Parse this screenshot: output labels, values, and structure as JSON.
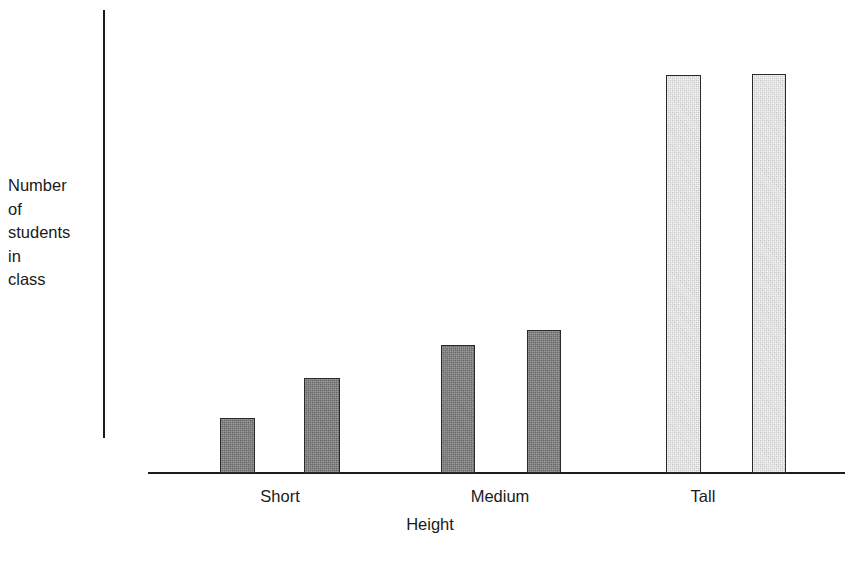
{
  "chart_data": {
    "type": "bar",
    "title": "",
    "subtitle": "",
    "xlabel": "Height",
    "ylabel": "Number\nof\nstudents\nin\nclass",
    "ylabel_lines": [
      "Number",
      "of",
      "students",
      "in",
      "class"
    ],
    "categories": [
      "Short",
      "Medium",
      "Tall"
    ],
    "grid": false,
    "legend": "none",
    "y_axis_ticks": [],
    "x_axis_ticks": [
      "Short",
      "Medium",
      "Tall"
    ],
    "ylim": [
      0,
      17
    ],
    "series": [
      {
        "name": "Group A",
        "values": [
          2,
          5,
          15
        ],
        "color": "#6e6e6e"
      },
      {
        "name": "Group B",
        "values": [
          3.5,
          5.5,
          15
        ],
        "color": "#6e6e6e"
      }
    ],
    "bars": [
      {
        "category": "Short",
        "member": 1,
        "value": 2,
        "fill": "dark",
        "left": 220,
        "width": 35,
        "top": 418,
        "height": 55
      },
      {
        "category": "Short",
        "member": 2,
        "value": 3.5,
        "fill": "dark",
        "left": 304,
        "width": 36,
        "top": 378,
        "height": 95
      },
      {
        "category": "Medium",
        "member": 1,
        "value": 5,
        "fill": "dark",
        "left": 441,
        "width": 34,
        "top": 345,
        "height": 128
      },
      {
        "category": "Medium",
        "member": 2,
        "value": 5.5,
        "fill": "dark",
        "left": 527,
        "width": 34,
        "top": 330,
        "height": 143
      },
      {
        "category": "Tall",
        "member": 1,
        "value": 15,
        "fill": "light",
        "left": 666,
        "width": 35,
        "top": 75,
        "height": 398
      },
      {
        "category": "Tall",
        "member": 2,
        "value": 15,
        "fill": "light",
        "left": 752,
        "width": 34,
        "top": 74,
        "height": 399
      }
    ],
    "category_label_positions": [
      280,
      500,
      703
    ],
    "colors": {
      "dark_bar": "#6e6e6e",
      "light_bar": "#d3d3d3",
      "bar_outline": "#2a2a2a",
      "axis": "#1c1c1c",
      "text": "#1a1a1a",
      "background": "#ffffff"
    }
  }
}
